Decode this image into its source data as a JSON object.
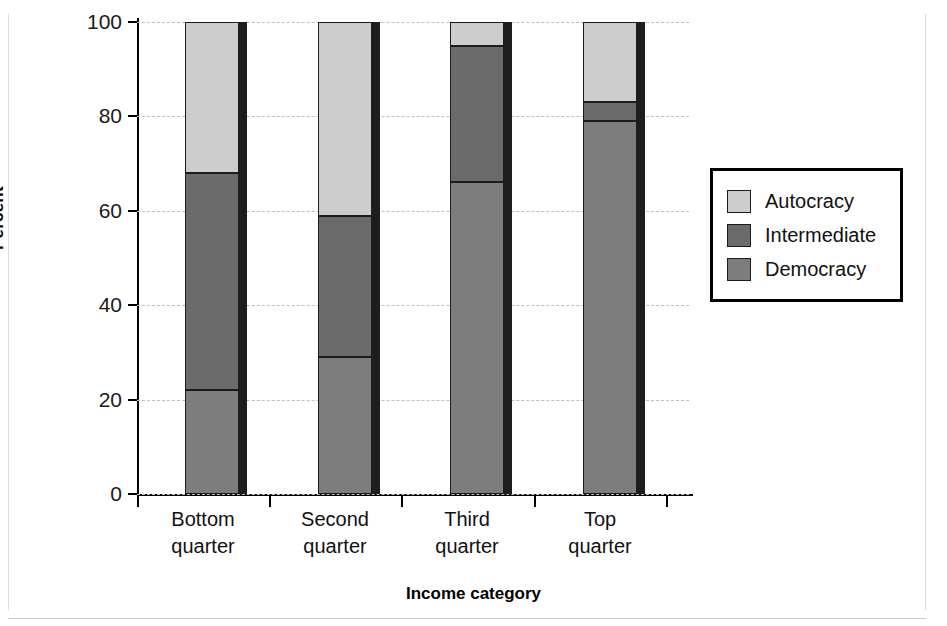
{
  "chart_data": {
    "type": "bar",
    "subtype": "stacked-bar-100",
    "title": "",
    "xlabel": "Income category",
    "ylabel": "Percent",
    "categories": [
      "Bottom quarter",
      "Second quarter",
      "Third quarter",
      "Top quarter"
    ],
    "category_lines": [
      [
        "Bottom",
        "quarter"
      ],
      [
        "Second",
        "quarter"
      ],
      [
        "Third",
        "quarter"
      ],
      [
        "Top",
        "quarter"
      ]
    ],
    "series": [
      {
        "name": "Democracy",
        "color": "#7d7d7d",
        "values": [
          22,
          29,
          66,
          79
        ]
      },
      {
        "name": "Intermediate",
        "color": "#6b6b6b",
        "values": [
          46,
          30,
          29,
          4
        ]
      },
      {
        "name": "Autocracy",
        "color": "#cdcdcd",
        "values": [
          32,
          41,
          5,
          17
        ]
      }
    ],
    "cumulative_tops": {
      "Democracy": [
        22,
        29,
        66,
        79
      ],
      "Intermediate": [
        68,
        59,
        95,
        83
      ],
      "Autocracy": [
        100,
        100,
        100,
        100
      ]
    },
    "ylim": [
      0,
      100
    ],
    "yticks": [
      0,
      20,
      40,
      60,
      80,
      100
    ],
    "ytick_labels": [
      "0",
      "20",
      "40",
      "60",
      "80",
      "100"
    ],
    "grid": true,
    "grid_axis": "y",
    "grid_style": "dashed",
    "legend_position": "right",
    "legend_order": [
      "Autocracy",
      "Intermediate",
      "Democracy"
    ]
  },
  "legend": {
    "items": [
      {
        "label": "Autocracy",
        "color": "#cdcdcd"
      },
      {
        "label": "Intermediate",
        "color": "#6b6b6b"
      },
      {
        "label": "Democracy",
        "color": "#7d7d7d"
      }
    ]
  },
  "axes": {
    "y_title": "Percent",
    "x_title": "Income category",
    "y_ticks": [
      "100",
      "80",
      "60",
      "40",
      "20",
      "0"
    ]
  }
}
